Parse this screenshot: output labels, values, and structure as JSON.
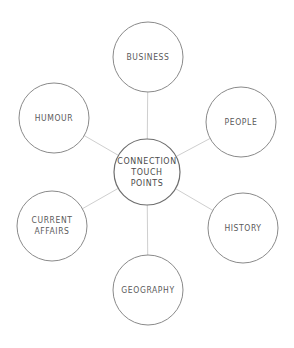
{
  "diagram": {
    "type": "hub-and-spoke mind map",
    "center": {
      "label_lines": [
        "CONNECTION",
        "TOUCH",
        "POINTS"
      ]
    },
    "nodes": [
      {
        "id": "business",
        "label_lines": [
          "BUSINESS"
        ]
      },
      {
        "id": "people",
        "label_lines": [
          "PEOPLE"
        ]
      },
      {
        "id": "history",
        "label_lines": [
          "HISTORY"
        ]
      },
      {
        "id": "geography",
        "label_lines": [
          "GEOGRAPHY"
        ]
      },
      {
        "id": "current-affairs",
        "label_lines": [
          "CURRENT",
          "AFFAIRS"
        ]
      },
      {
        "id": "humour",
        "label_lines": [
          "HUMOUR"
        ]
      }
    ],
    "colors": {
      "circle_stroke": "#8a8a8a",
      "connector": "#cfcfcf",
      "text": "#5a5a5a"
    }
  }
}
